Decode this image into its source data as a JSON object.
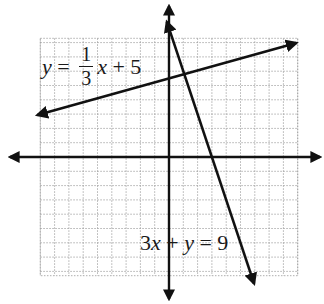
{
  "chart_data": {
    "type": "line",
    "title": "",
    "xlabel": "",
    "ylabel": "",
    "grid": true,
    "xlim": [
      -9,
      9
    ],
    "ylim": [
      -8.3,
      8.3
    ],
    "axis_arrows": true,
    "tick_labels": [],
    "series": [
      {
        "name": "y = 1/3 x + 5",
        "equation": "y = (1/3)x + 5",
        "slope": 0.3333,
        "intercept": 5,
        "x": [
          -9.2,
          8.9
        ],
        "y": [
          2.93,
          7.97
        ],
        "arrows": "both"
      },
      {
        "name": "3x + y = 9",
        "equation": "y = -3x + 9",
        "slope": -3,
        "intercept": 9,
        "x": [
          -0.15,
          5.95
        ],
        "y": [
          9.45,
          -8.85
        ],
        "arrows": "both"
      }
    ],
    "intersection": {
      "x": 1.2,
      "y": 5.4
    },
    "annotations": [
      {
        "text": "y = 1/3 x + 5",
        "near": "upper-left"
      },
      {
        "text": "3x + y = 9",
        "near": "lower-center"
      }
    ]
  },
  "labels": {
    "line1": {
      "lhs": "y",
      "eq": " = ",
      "num": "1",
      "den": "3",
      "var": "x",
      "rest": " + 5"
    },
    "line2": {
      "coef": "3",
      "x": "x",
      "plus": " + ",
      "y": "y",
      "rest": " = 9"
    }
  },
  "style": {
    "axis_color": "#111111",
    "line_color": "#111111",
    "grid_color": "#9a9a9a"
  }
}
